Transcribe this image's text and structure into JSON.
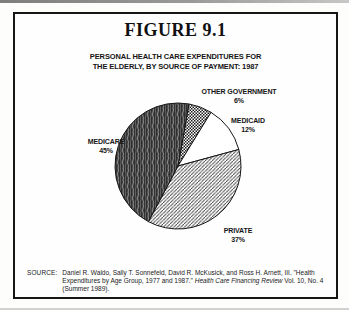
{
  "figure": {
    "title": "FIGURE 9.1"
  },
  "chart_data": {
    "type": "pie",
    "title": "PERSONAL HEALTH CARE EXPENDITURES FOR THE ELDERLY, BY SOURCE OF PAYMENT: 1987",
    "title_lines": [
      "PERSONAL HEALTH CARE EXPENDITURES FOR",
      "THE ELDERLY, BY SOURCE OF PAYMENT: 1987"
    ],
    "start_angle_deg": 10,
    "legend_position": "labels-outside-slices",
    "slices": [
      {
        "label": "OTHER GOVERNMENT",
        "value": 6,
        "pct": "6%",
        "pattern": "checker"
      },
      {
        "label": "MEDICAID",
        "value": 12,
        "pct": "12%",
        "pattern": "white"
      },
      {
        "label": "PRIVATE",
        "value": 37,
        "pct": "37%",
        "pattern": "diagonal"
      },
      {
        "label": "MEDICARE",
        "value": 45,
        "pct": "45%",
        "pattern": "dark"
      }
    ],
    "colors": {
      "outline": "#161616",
      "dark_slice_base": "#2e2e2e",
      "hatch_line": "#3c3c3c"
    }
  },
  "source": {
    "label": "SOURCE:",
    "text_before_italic": "Daniel R. Waldo, Sally T. Sonnefeld, David R. McKusick, and Ross H. Arnett, III. \"Health Expenditures by Age Group, 1977 and 1987.\" ",
    "italic": "Health Care Financing Review",
    "text_after_italic": " Vol. 10, No. 4 (Summer 1989)."
  }
}
